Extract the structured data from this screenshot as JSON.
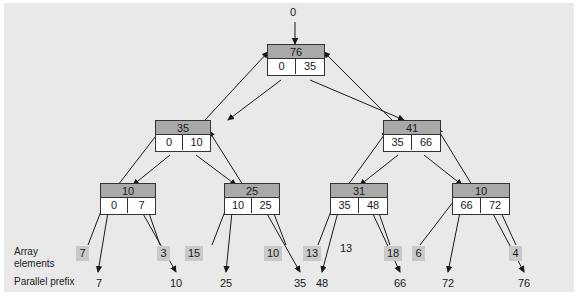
{
  "diagram": {
    "title_value": "0",
    "row_labels": {
      "array_elements_line1": "Array",
      "array_elements_line2": "elements",
      "parallel_prefix": "Parallel prefix"
    },
    "nodes": [
      {
        "id": "root",
        "sum": "76",
        "left": "0",
        "right": "35"
      },
      {
        "id": "n-l",
        "sum": "35",
        "left": "0",
        "right": "10"
      },
      {
        "id": "n-r",
        "sum": "41",
        "left": "35",
        "right": "66"
      },
      {
        "id": "n-ll",
        "sum": "10",
        "left": "0",
        "right": "7"
      },
      {
        "id": "n-lr",
        "sum": "25",
        "left": "10",
        "right": "25"
      },
      {
        "id": "n-rl",
        "sum": "31",
        "left": "35",
        "right": "48"
      },
      {
        "id": "n-rr",
        "sum": "10",
        "left": "66",
        "right": "72"
      }
    ],
    "array_elements": [
      "7",
      "3",
      "15",
      "10",
      "13",
      "18",
      "6",
      "4"
    ],
    "parallel_prefix_values": [
      "7",
      "10",
      "25",
      "35",
      "48",
      "66",
      "72",
      "76"
    ],
    "annotation_number": "13",
    "colors": {
      "panel_background": "#e9e9e9",
      "node_header": "#a9a9a9",
      "node_body": "#ffffff",
      "node_border": "#333333",
      "element_box": "#c9c9c9",
      "arrow": "#1a1a1a"
    }
  }
}
